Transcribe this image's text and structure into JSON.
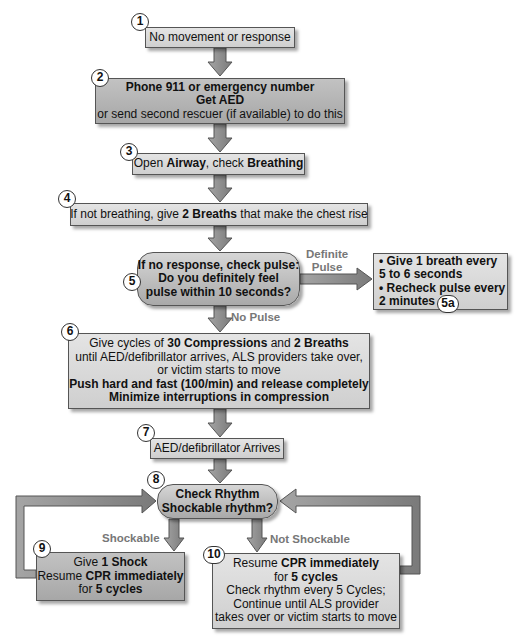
{
  "diagram": {
    "type": "flowchart",
    "colors": {
      "box_fill_light": "#dcdcdc",
      "box_fill_dark": "#b0b0b0",
      "arrow_fill": "#8c8c8c",
      "arrow_stroke": "#555555",
      "branch_label": "#777777"
    },
    "steps": [
      {
        "id": "1",
        "lines": [
          {
            "text": "No movement or response"
          }
        ]
      },
      {
        "id": "2",
        "lines": [
          {
            "bold": "Phone 911 or emergency number"
          },
          {
            "bold": "Get AED"
          },
          {
            "text": "or send second rescuer (if available) to do this"
          }
        ]
      },
      {
        "id": "3",
        "parts": [
          "Open ",
          "Airway",
          ", check ",
          "Breathing"
        ]
      },
      {
        "id": "4",
        "parts": [
          "If not breathing, give ",
          "2 Breaths",
          " that make the chest rise"
        ]
      },
      {
        "id": "5",
        "lines": [
          "If no response, check pulse:",
          "Do you definitely feel",
          "pulse within 10 seconds?"
        ]
      },
      {
        "id": "5a",
        "lines": [
          "• Give 1 breath every",
          "5 to 6 seconds",
          "• Recheck pulse every",
          "2 minutes"
        ]
      },
      {
        "id": "6",
        "line1_parts": [
          "Give cycles of ",
          "30 Compressions",
          " and ",
          "2 Breaths"
        ],
        "line2": "until AED/defibrillator arrives, ALS providers take over,",
        "line3": "or victim starts to move",
        "line4": "Push hard and fast (100/min) and release completely",
        "line5": "Minimize interruptions in compression"
      },
      {
        "id": "7",
        "text": "AED/defibrillator Arrives"
      },
      {
        "id": "8",
        "lines": [
          "Check Rhythm",
          "Shockable rhythm?"
        ]
      },
      {
        "id": "9",
        "line1_parts": [
          "Give ",
          "1 Shock"
        ],
        "line2_parts": [
          "Resume ",
          "CPR immediately"
        ],
        "line3_parts": [
          "for ",
          "5 cycles"
        ]
      },
      {
        "id": "10",
        "line1_parts": [
          "Resume ",
          "CPR immediately"
        ],
        "line2_parts": [
          "for ",
          "5 cycles"
        ],
        "line3": "Check rhythm every 5 Cycles;",
        "line4": "Continue until ALS provider",
        "line5": "takes over or victim starts to move"
      }
    ],
    "branch_labels": {
      "definite_pulse_1": "Definite",
      "definite_pulse_2": "Pulse",
      "no_pulse": "No Pulse",
      "shockable": "Shockable",
      "not_shockable": "Not Shockable"
    }
  }
}
